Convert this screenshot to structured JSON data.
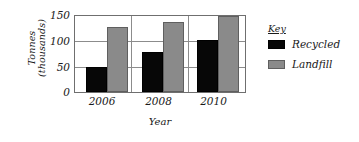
{
  "chart_data": {
    "type": "bar",
    "title": "",
    "xlabel": "Year",
    "ylabel": "Tonnes (thousands)",
    "ylabel_line1": "Tonnes",
    "ylabel_line2": "(thousands)",
    "categories": [
      "2006",
      "2008",
      "2010"
    ],
    "yticks": [
      "0",
      "50",
      "100",
      "150"
    ],
    "ylim": [
      0,
      150
    ],
    "grid": true,
    "legend_position": "right",
    "legend_title": "Key",
    "series": [
      {
        "name": "Recycled",
        "color": "#070707",
        "values": [
          50,
          78,
          102
        ]
      },
      {
        "name": "Landfill",
        "color": "#8a8a8a",
        "values": [
          128,
          139,
          150
        ]
      }
    ]
  }
}
